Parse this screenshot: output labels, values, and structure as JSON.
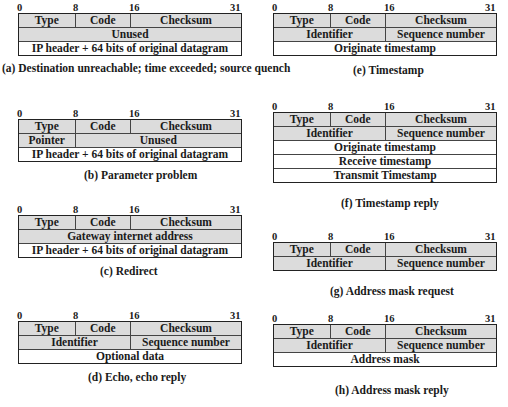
{
  "bit_labels": [
    "0",
    "8",
    "16",
    "31"
  ],
  "panels": [
    {
      "id": "a",
      "caption": "(a) Destination unreachable; time exceeded; source quench",
      "rows": [
        [
          {
            "text": "Type",
            "span": 8,
            "shaded": true
          },
          {
            "text": "Code",
            "span": 8,
            "shaded": true
          },
          {
            "text": "Checksum",
            "span": 16,
            "shaded": true
          }
        ],
        [
          {
            "text": "Unused",
            "span": 32,
            "shaded": true
          }
        ],
        [
          {
            "text": "IP header + 64 bits of original datagram",
            "span": 32,
            "shaded": false
          }
        ]
      ]
    },
    {
      "id": "b",
      "caption": "(b) Parameter problem",
      "rows": [
        [
          {
            "text": "Type",
            "span": 8,
            "shaded": true
          },
          {
            "text": "Code",
            "span": 8,
            "shaded": true
          },
          {
            "text": "Checksum",
            "span": 16,
            "shaded": true
          }
        ],
        [
          {
            "text": "Pointer",
            "span": 8,
            "shaded": true
          },
          {
            "text": "Unused",
            "span": 24,
            "shaded": true
          }
        ],
        [
          {
            "text": "IP header + 64 bits of original datagram",
            "span": 32,
            "shaded": false
          }
        ]
      ]
    },
    {
      "id": "c",
      "caption": "(c) Redirect",
      "rows": [
        [
          {
            "text": "Type",
            "span": 8,
            "shaded": true
          },
          {
            "text": "Code",
            "span": 8,
            "shaded": true
          },
          {
            "text": "Checksum",
            "span": 16,
            "shaded": true
          }
        ],
        [
          {
            "text": "Gateway internet address",
            "span": 32,
            "shaded": true
          }
        ],
        [
          {
            "text": "IP header + 64 bits of original datagram",
            "span": 32,
            "shaded": false
          }
        ]
      ]
    },
    {
      "id": "d",
      "caption": "(d) Echo, echo reply",
      "rows": [
        [
          {
            "text": "Type",
            "span": 8,
            "shaded": true
          },
          {
            "text": "Code",
            "span": 8,
            "shaded": true
          },
          {
            "text": "Checksum",
            "span": 16,
            "shaded": true
          }
        ],
        [
          {
            "text": "Identifier",
            "span": 16,
            "shaded": true
          },
          {
            "text": "Sequence number",
            "span": 16,
            "shaded": true
          }
        ],
        [
          {
            "text": "Optional data",
            "span": 32,
            "shaded": false
          }
        ]
      ]
    },
    {
      "id": "e",
      "caption": "(e) Timestamp",
      "rows": [
        [
          {
            "text": "Type",
            "span": 8,
            "shaded": true
          },
          {
            "text": "Code",
            "span": 8,
            "shaded": true
          },
          {
            "text": "Checksum",
            "span": 16,
            "shaded": true
          }
        ],
        [
          {
            "text": "Identifier",
            "span": 16,
            "shaded": true
          },
          {
            "text": "Sequence number",
            "span": 16,
            "shaded": true
          }
        ],
        [
          {
            "text": "Originate timestamp",
            "span": 32,
            "shaded": false
          }
        ]
      ]
    },
    {
      "id": "f",
      "caption": "(f) Timestamp reply",
      "rows": [
        [
          {
            "text": "Type",
            "span": 8,
            "shaded": true
          },
          {
            "text": "Code",
            "span": 8,
            "shaded": true
          },
          {
            "text": "Checksum",
            "span": 16,
            "shaded": true
          }
        ],
        [
          {
            "text": "Identifier",
            "span": 16,
            "shaded": true
          },
          {
            "text": "Sequence number",
            "span": 16,
            "shaded": true
          }
        ],
        [
          {
            "text": "Originate timestamp",
            "span": 32,
            "shaded": false
          }
        ],
        [
          {
            "text": "Receive timestamp",
            "span": 32,
            "shaded": false
          }
        ],
        [
          {
            "text": "Transmit Timestamp",
            "span": 32,
            "shaded": false
          }
        ]
      ]
    },
    {
      "id": "g",
      "caption": "(g) Address mask request",
      "rows": [
        [
          {
            "text": "Type",
            "span": 8,
            "shaded": true
          },
          {
            "text": "Code",
            "span": 8,
            "shaded": true
          },
          {
            "text": "Checksum",
            "span": 16,
            "shaded": true
          }
        ],
        [
          {
            "text": "Identifier",
            "span": 16,
            "shaded": true
          },
          {
            "text": "Sequence number",
            "span": 16,
            "shaded": true
          }
        ]
      ]
    },
    {
      "id": "h",
      "caption": "(h) Address mask reply",
      "rows": [
        [
          {
            "text": "Type",
            "span": 8,
            "shaded": true
          },
          {
            "text": "Code",
            "span": 8,
            "shaded": true
          },
          {
            "text": "Checksum",
            "span": 16,
            "shaded": true
          }
        ],
        [
          {
            "text": "Identifier",
            "span": 16,
            "shaded": true
          },
          {
            "text": "Sequence number",
            "span": 16,
            "shaded": true
          }
        ],
        [
          {
            "text": "Address mask",
            "span": 32,
            "shaded": false
          }
        ]
      ]
    }
  ]
}
